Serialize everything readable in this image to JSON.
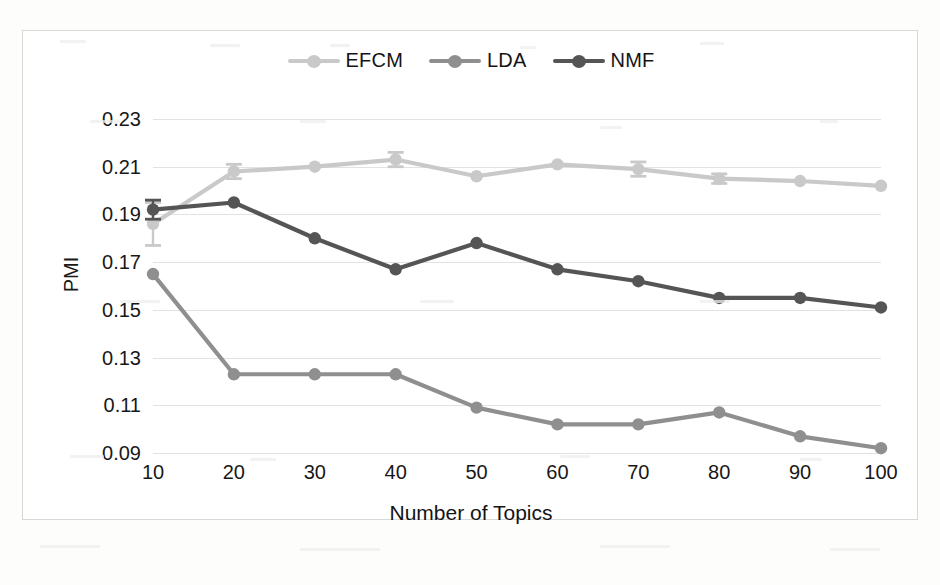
{
  "chart_data": {
    "type": "line",
    "title": "",
    "xlabel": "Number of Topics",
    "ylabel": "PMI",
    "x": [
      10,
      20,
      30,
      40,
      50,
      60,
      70,
      80,
      90,
      100
    ],
    "categories": [
      "10",
      "20",
      "30",
      "40",
      "50",
      "60",
      "70",
      "80",
      "90",
      "100"
    ],
    "xlim": [
      10,
      100
    ],
    "ylim": [
      0.09,
      0.23
    ],
    "yticks": [
      0.09,
      0.11,
      0.13,
      0.15,
      0.17,
      0.19,
      0.21,
      0.23
    ],
    "ytick_labels": [
      "0.09",
      "0.11",
      "0.13",
      "0.15",
      "0.17",
      "0.19",
      "0.21",
      "0.23"
    ],
    "grid": "horizontal",
    "legend_position": "top-center",
    "series": [
      {
        "name": "EFCM",
        "color": "#c9c9c9",
        "values": [
          0.186,
          0.208,
          0.21,
          0.213,
          0.206,
          0.211,
          0.209,
          0.205,
          0.204,
          0.202
        ],
        "errors": [
          0.009,
          0.003,
          0.0,
          0.003,
          0.0,
          0.0,
          0.003,
          0.002,
          0.0,
          0.0
        ]
      },
      {
        "name": "LDA",
        "color": "#8f8f8f",
        "values": [
          0.165,
          0.123,
          0.123,
          0.123,
          0.109,
          0.102,
          0.102,
          0.107,
          0.097,
          0.092
        ],
        "errors": [
          0,
          0,
          0,
          0,
          0,
          0,
          0,
          0,
          0,
          0
        ]
      },
      {
        "name": "NMF",
        "color": "#555555",
        "values": [
          0.192,
          0.195,
          0.18,
          0.167,
          0.178,
          0.167,
          0.162,
          0.155,
          0.155,
          0.151
        ],
        "errors": [
          0.004,
          0.0,
          0.0,
          0.0,
          0.0,
          0.0,
          0.0,
          0.0,
          0.0,
          0.0
        ]
      }
    ]
  },
  "legend": {
    "items": [
      {
        "label": "EFCM",
        "color": "#c9c9c9"
      },
      {
        "label": "LDA",
        "color": "#8f8f8f"
      },
      {
        "label": "NMF",
        "color": "#555555"
      }
    ]
  },
  "axes": {
    "y_title": "PMI",
    "x_title": "Number of Topics"
  }
}
